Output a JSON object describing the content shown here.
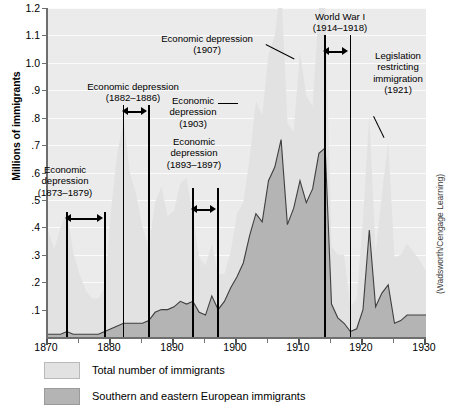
{
  "axes": {
    "y_title": "Millions of immigrants",
    "y_ticks": [
      "1.2",
      "1.1",
      "1.0",
      ".9",
      ".8",
      ".7",
      ".6",
      ".5",
      ".4",
      ".3",
      ".2",
      ".1"
    ],
    "y_tick_values": [
      1.2,
      1.1,
      1.0,
      0.9,
      0.8,
      0.7,
      0.6,
      0.5,
      0.4,
      0.3,
      0.2,
      0.1
    ],
    "x_ticks": [
      "1870",
      "1880",
      "1890",
      "1900",
      "1910",
      "1920",
      "1930"
    ],
    "x_tick_values": [
      1870,
      1880,
      1890,
      1900,
      1910,
      1920,
      1930
    ]
  },
  "credit": "(Wadsworth/Cengage Learning)",
  "legend": {
    "items": [
      {
        "label": "Total number of immigrants",
        "color": "#e2e2e2"
      },
      {
        "label": "Southern and eastern European immigrants",
        "color": "#b4b4b4"
      }
    ]
  },
  "annotations": [
    {
      "id": "depression-1873",
      "text": "Economic\ndepression\n(1873–1879)",
      "span_start": 1873,
      "span_end": 1879
    },
    {
      "id": "depression-1882",
      "text": "Economic depression\n(1882–1886)",
      "span_start": 1882,
      "span_end": 1886
    },
    {
      "id": "depression-1893",
      "text": "Economic\ndepression\n(1893–1897)",
      "span_start": 1893,
      "span_end": 1897
    },
    {
      "id": "depression-1903",
      "text": "Economic\ndepression\n(1903)",
      "span_start": 1903,
      "span_end": 1903
    },
    {
      "id": "depression-1907",
      "text": "Economic depression\n(1907)",
      "span_start": 1907,
      "span_end": 1907
    },
    {
      "id": "world-war-one",
      "text": "World War I\n(1914–1918)",
      "span_start": 1914,
      "span_end": 1918
    },
    {
      "id": "legislation-1921",
      "text": "Legislation\nrestricting\nimmigration\n(1921)",
      "span_start": 1921,
      "span_end": 1921
    }
  ],
  "chart_data": {
    "type": "area",
    "title": "",
    "xlabel": "",
    "ylabel": "Millions of immigrants",
    "xlim": [
      1870,
      1930
    ],
    "ylim": [
      0,
      1.2
    ],
    "grid": true,
    "legend_position": "below",
    "x": [
      1870,
      1871,
      1872,
      1873,
      1874,
      1875,
      1876,
      1877,
      1878,
      1879,
      1880,
      1881,
      1882,
      1883,
      1884,
      1885,
      1886,
      1887,
      1888,
      1889,
      1890,
      1891,
      1892,
      1893,
      1894,
      1895,
      1896,
      1897,
      1898,
      1899,
      1900,
      1901,
      1902,
      1903,
      1904,
      1905,
      1906,
      1907,
      1908,
      1909,
      1910,
      1911,
      1912,
      1913,
      1914,
      1915,
      1916,
      1917,
      1918,
      1919,
      1920,
      1921,
      1922,
      1923,
      1924,
      1925,
      1926,
      1927,
      1928,
      1929,
      1930
    ],
    "series": [
      {
        "name": "Total number of immigrants",
        "color": "#e2e2e2",
        "values": [
          0.39,
          0.32,
          0.4,
          0.46,
          0.31,
          0.23,
          0.17,
          0.14,
          0.14,
          0.18,
          0.46,
          0.67,
          0.79,
          0.6,
          0.52,
          0.4,
          0.33,
          0.49,
          0.55,
          0.44,
          0.46,
          0.56,
          0.58,
          0.44,
          0.29,
          0.26,
          0.34,
          0.23,
          0.23,
          0.31,
          0.45,
          0.49,
          0.65,
          0.86,
          0.81,
          1.03,
          1.1,
          1.29,
          0.78,
          0.75,
          1.04,
          0.88,
          0.84,
          1.2,
          1.22,
          0.33,
          0.3,
          0.3,
          0.11,
          0.14,
          0.43,
          0.81,
          0.31,
          0.52,
          0.71,
          0.29,
          0.3,
          0.34,
          0.31,
          0.28,
          0.24
        ]
      },
      {
        "name": "Southern and eastern European immigrants",
        "color": "#b4b4b4",
        "values": [
          0.01,
          0.01,
          0.01,
          0.02,
          0.01,
          0.01,
          0.01,
          0.01,
          0.01,
          0.02,
          0.03,
          0.04,
          0.05,
          0.05,
          0.05,
          0.05,
          0.06,
          0.09,
          0.1,
          0.1,
          0.11,
          0.13,
          0.12,
          0.13,
          0.09,
          0.08,
          0.15,
          0.1,
          0.13,
          0.18,
          0.22,
          0.27,
          0.37,
          0.45,
          0.42,
          0.57,
          0.62,
          0.72,
          0.41,
          0.47,
          0.57,
          0.49,
          0.54,
          0.67,
          0.69,
          0.12,
          0.07,
          0.05,
          0.02,
          0.03,
          0.1,
          0.39,
          0.11,
          0.16,
          0.19,
          0.05,
          0.06,
          0.08,
          0.08,
          0.08,
          0.08
        ]
      }
    ]
  }
}
